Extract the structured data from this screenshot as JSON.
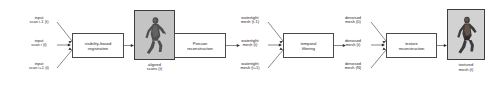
{
  "figure": {
    "type": "pipeline-flow-diagram",
    "title": "",
    "orientation": "left-to-right",
    "colors": {
      "stroke": "#3a3a3a",
      "box_border": "#4a4a4a",
      "text": "#1a1a1a",
      "background": "#ffffff",
      "thumbnail_border": "#3d3d3d"
    }
  },
  "inputs": [
    {
      "id": "input-scan-prev",
      "line1": "input",
      "line2": "scan i-1 (t)"
    },
    {
      "id": "input-scan-curr",
      "line1": "input",
      "line2": "scan i (t)"
    },
    {
      "id": "input-scan-next",
      "line1": "input",
      "line2": "scan i+1 (t)"
    }
  ],
  "stages": [
    {
      "id": "visibility-based-registration",
      "line1": "visibility-based",
      "line2": "registration"
    },
    {
      "id": "poisson-reconstruction",
      "line1": "Poisson",
      "line2": "reconstruction"
    },
    {
      "id": "temporal-filtering",
      "line1": "temporal",
      "line2": "filtering"
    },
    {
      "id": "texture-reconstruction",
      "line1": "texture",
      "line2": "reconstruction"
    }
  ],
  "intermediates": {
    "aligned_scans": {
      "id": "aligned-scans",
      "line1": "aligned",
      "line2": "scans (t)"
    },
    "watertight": [
      {
        "id": "watertight-mesh-prev",
        "line1": "watertight",
        "line2": "mesh (t-1)"
      },
      {
        "id": "watertight-mesh-curr",
        "line1": "watertight",
        "line2": "mesh (t)"
      },
      {
        "id": "watertight-mesh-next",
        "line1": "watertight",
        "line2": "mesh (t+1)"
      }
    ],
    "denoised": [
      {
        "id": "denoised-mesh-0",
        "line1": "denoised",
        "line2": "mesh (0)"
      },
      {
        "id": "denoised-mesh-t",
        "line1": "denoised",
        "line2": "mesh (t)"
      },
      {
        "id": "denoised-mesh-N",
        "line1": "denoised",
        "line2": "mesh (N)"
      }
    ]
  },
  "outputs": {
    "textured_mesh": {
      "id": "textured-mesh",
      "line1": "textured",
      "line2": "mesh (t)"
    }
  },
  "thumbnails": [
    {
      "id": "aligned-scans-thumbnail",
      "caption_ref": "aligned_scans",
      "subject": "dancing-person-point-cloud"
    },
    {
      "id": "textured-mesh-thumbnail",
      "caption_ref": "textured_mesh",
      "subject": "dancing-person-textured"
    }
  ]
}
